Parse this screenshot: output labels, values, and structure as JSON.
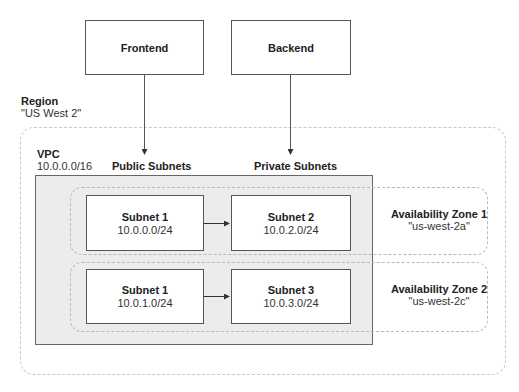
{
  "top_services": [
    {
      "label": "Frontend"
    },
    {
      "label": "Backend"
    }
  ],
  "region": {
    "title": "Region",
    "name": "\"US West 2\""
  },
  "vpc": {
    "title": "VPC",
    "cidr": "10.0.0.0/16"
  },
  "columns": {
    "public": "Public Subnets",
    "private": "Private Subnets"
  },
  "availability_zones": [
    {
      "title": "Availability Zone 1",
      "name": "\"us-west-2a\"",
      "public_subnet": {
        "title": "Subnet 1",
        "cidr": "10.0.0.0/24"
      },
      "private_subnet": {
        "title": "Subnet 2",
        "cidr": "10.0.2.0/24"
      }
    },
    {
      "title": "Availability Zone 2",
      "name": "\"us-west-2c\"",
      "public_subnet": {
        "title": "Subnet 1",
        "cidr": "10.0.1.0/24"
      },
      "private_subnet": {
        "title": "Subnet 3",
        "cidr": "10.0.3.0/24"
      }
    }
  ],
  "connections": [
    {
      "from": "Frontend",
      "to": "Public Subnets"
    },
    {
      "from": "Backend",
      "to": "Private Subnets"
    },
    {
      "from": "Subnet 1 (10.0.0.0/24)",
      "to": "Subnet 2 (10.0.2.0/24)"
    },
    {
      "from": "Subnet 1 (10.0.1.0/24)",
      "to": "Subnet 3 (10.0.3.0/24)"
    }
  ],
  "colors": {
    "vpc_fill": "#ececec",
    "box_border": "#555555",
    "dashed": "#c0c0c0",
    "arrow": "#333333"
  }
}
